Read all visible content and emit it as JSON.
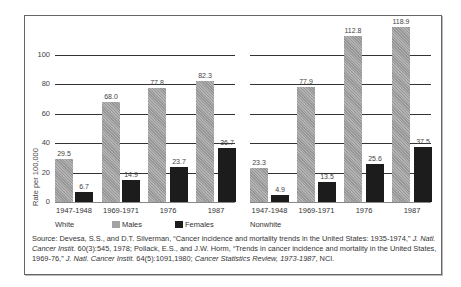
{
  "chart_data": [
    {
      "type": "bar",
      "panel": "White",
      "categories": [
        "1947-1948",
        "1969-1971",
        "1976",
        "1987"
      ],
      "series": [
        {
          "name": "Males",
          "values": [
            29.5,
            68.0,
            77.8,
            82.3
          ],
          "color": "#a3a3a3"
        },
        {
          "name": "Females",
          "values": [
            6.7,
            14.9,
            23.7,
            36.7
          ],
          "color": "#1c1c1c"
        }
      ],
      "ylabel": "Rate per 100,000",
      "yticks": [
        0,
        20,
        40,
        60,
        80,
        100
      ],
      "ylim": [
        0,
        120
      ],
      "grid": true
    },
    {
      "type": "bar",
      "panel": "Nonwhite",
      "categories": [
        "1947-1948",
        "1969-1971",
        "1976",
        "1987"
      ],
      "series": [
        {
          "name": "Males",
          "values": [
            23.3,
            77.9,
            112.8,
            118.9
          ],
          "color": "#a3a3a3"
        },
        {
          "name": "Females",
          "values": [
            4.9,
            13.5,
            25.6,
            37.5
          ],
          "color": "#1c1c1c"
        }
      ],
      "ylabel": "Rate per 100,000",
      "yticks": [
        0,
        20,
        40,
        60,
        80,
        100
      ],
      "ylim": [
        0,
        120
      ],
      "grid": true
    }
  ],
  "axis": {
    "ylabel": "Rate per 100,000",
    "ticks": [
      "0",
      "20",
      "40",
      "60",
      "80",
      "100"
    ]
  },
  "panels": [
    {
      "name": "White",
      "categories": [
        "1947-1948",
        "1969-1971",
        "1976",
        "1987"
      ],
      "males": [
        "29.5",
        "68.0",
        "77.8",
        "82.3"
      ],
      "females": [
        "6.7",
        "14.9",
        "23.7",
        "36.7"
      ]
    },
    {
      "name": "Nonwhite",
      "categories": [
        "1947-1948",
        "1969-1971",
        "1976",
        "1987"
      ],
      "males": [
        "23.3",
        "77.9",
        "112.8",
        "118.9"
      ],
      "females": [
        "4.9",
        "13.5",
        "25.6",
        "37.5"
      ]
    }
  ],
  "legend": {
    "males": "Males",
    "females": "Females",
    "males_color": "#a3a3a3",
    "females_color": "#1c1c1c"
  },
  "source": {
    "prefix": "Source:  Devesa, S.S., and D.T. Silverman, “Cancer incidence and mortality trends in the United States: 1935-1974,” ",
    "j1": "J. Natl. Cancer Instit.",
    "mid1": " 60(3):545, 1978; Pollack, E.S., and J.W. Horm, “Trends in cancer incidence and mortality in the United States, 1969-76,” ",
    "j2": "J. Natl. Cancer Instit.",
    "mid2": " 64(5):1091,1980; ",
    "j3": "Cancer Statistics Review, 1973-1987",
    "suffix": ", NCI."
  }
}
